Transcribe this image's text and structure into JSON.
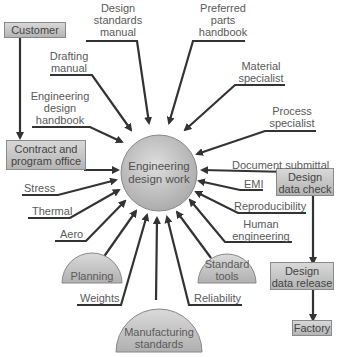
{
  "diagram": {
    "center": {
      "label_line1": "Engineering",
      "label_line2": "design work"
    },
    "top_inputs": {
      "design_standards_manual": {
        "l1": "Design",
        "l2": "standards",
        "l3": "manual"
      },
      "preferred_parts_handbook": {
        "l1": "Preferred",
        "l2": "parts",
        "l3": "handbook"
      },
      "drafting_manual": {
        "l1": "Drafting",
        "l2": "manual"
      },
      "engineering_design_handbook": {
        "l1": "Engineering",
        "l2": "design",
        "l3": "handbook"
      },
      "material_specialist": {
        "l1": "Material",
        "l2": "specialist"
      },
      "process_specialist": {
        "l1": "Process",
        "l2": "specialist"
      }
    },
    "left_inputs": {
      "stress": "Stress",
      "thermal": "Thermal",
      "aero": "Aero"
    },
    "right_inputs": {
      "document_submittal": "Document submittal",
      "emi": "EMI",
      "reproducibility": "Reproducibility",
      "human_engineering": {
        "l1": "Human",
        "l2": "engineering"
      }
    },
    "bottom_inputs": {
      "planning": "Planning",
      "weights": "Weights",
      "manufacturing_standards": {
        "l1": "Manufacturing",
        "l2": "standards"
      },
      "reliability": "Reliability",
      "standard_tools": {
        "l1": "Standard",
        "l2": "tools"
      }
    },
    "boxes": {
      "customer": "Customer",
      "contract_program_office": {
        "l1": "Contract and",
        "l2": "program office"
      },
      "design_data_check": {
        "l1": "Design",
        "l2": "data check"
      },
      "design_data_release": {
        "l1": "Design",
        "l2": "data release"
      },
      "factory": "Factory"
    },
    "colors": {
      "line": "#3a3a3a",
      "fill_light": "#d8d8d8",
      "fill_dark": "#b0b0b0",
      "text": "#5a5a5a"
    }
  }
}
